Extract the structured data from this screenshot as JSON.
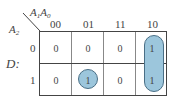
{
  "kmap": {
    "col_var": "A1A0",
    "col_var_parts": {
      "a": "A",
      "a_sub": "1",
      "b": "A",
      "b_sub": "0"
    },
    "row_var": {
      "base": "A",
      "sub": "2"
    },
    "output_label": "D:",
    "col_headers": [
      "00",
      "01",
      "11",
      "10"
    ],
    "row_headers": [
      "0",
      "1"
    ],
    "cells": [
      [
        "0",
        "0",
        "0",
        "1"
      ],
      [
        "0",
        "1",
        "0",
        "1"
      ]
    ],
    "groups": [
      {
        "cells": [
          "r0c3",
          "r1c3"
        ],
        "shape": "vertical-pill"
      },
      {
        "cells": [
          "r1c1"
        ],
        "shape": "circle"
      }
    ],
    "loop_color": "#9cc6dc"
  }
}
